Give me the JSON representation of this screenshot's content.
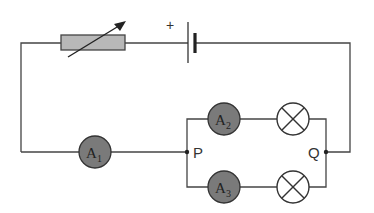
{
  "diagram": {
    "type": "electric-circuit",
    "colors": {
      "wire": "#444444",
      "ammeter_fill": "#7a7a7a",
      "rheostat_fill": "#b8b8b8",
      "background": "#ffffff"
    },
    "battery": {
      "polarity_label": "+"
    },
    "rheostat": {
      "label": "variable resistor"
    },
    "ammeters": [
      {
        "id": "A1",
        "letter": "A",
        "subscript": "1",
        "position": "main line"
      },
      {
        "id": "A2",
        "letter": "A",
        "subscript": "2",
        "position": "upper branch"
      },
      {
        "id": "A3",
        "letter": "A",
        "subscript": "3",
        "position": "lower branch"
      }
    ],
    "lamps": [
      {
        "id": "L1",
        "position": "upper branch"
      },
      {
        "id": "L2",
        "position": "lower branch"
      }
    ],
    "junctions": [
      {
        "id": "P",
        "label": "P"
      },
      {
        "id": "Q",
        "label": "Q"
      }
    ]
  }
}
